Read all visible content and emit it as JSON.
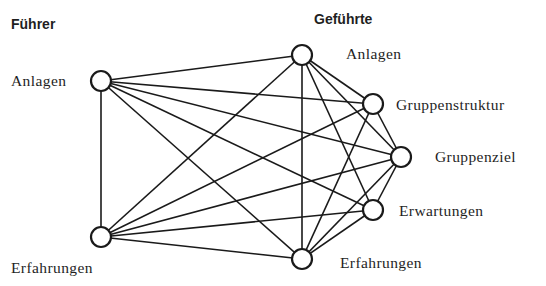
{
  "headings": {
    "leader": "Führer",
    "followers": "Geführte"
  },
  "nodes": [
    {
      "id": "fA",
      "group": "leader",
      "label": "Anlagen",
      "x": 101,
      "y": 81
    },
    {
      "id": "fE",
      "group": "leader",
      "label": "Erfahrungen",
      "x": 101,
      "y": 237
    },
    {
      "id": "gA",
      "group": "follower",
      "label": "Anlagen",
      "x": 302,
      "y": 55
    },
    {
      "id": "gS",
      "group": "follower",
      "label": "Gruppenstruktur",
      "x": 373,
      "y": 104
    },
    {
      "id": "gZ",
      "group": "follower",
      "label": "Gruppenziel",
      "x": 401,
      "y": 157
    },
    {
      "id": "gW",
      "group": "follower",
      "label": "Erwartungen",
      "x": 373,
      "y": 210
    },
    {
      "id": "gE",
      "group": "follower",
      "label": "Erfahrungen",
      "x": 302,
      "y": 259
    }
  ],
  "edges": [
    [
      "fA",
      "fE"
    ],
    [
      "fA",
      "gA"
    ],
    [
      "fA",
      "gS"
    ],
    [
      "fA",
      "gZ"
    ],
    [
      "fA",
      "gW"
    ],
    [
      "fA",
      "gE"
    ],
    [
      "fE",
      "gA"
    ],
    [
      "fE",
      "gS"
    ],
    [
      "fE",
      "gZ"
    ],
    [
      "fE",
      "gW"
    ],
    [
      "fE",
      "gE"
    ],
    [
      "gA",
      "gS"
    ],
    [
      "gA",
      "gZ"
    ],
    [
      "gA",
      "gW"
    ],
    [
      "gA",
      "gE"
    ],
    [
      "gS",
      "gZ"
    ],
    [
      "gS",
      "gE"
    ],
    [
      "gZ",
      "gW"
    ],
    [
      "gZ",
      "gE"
    ],
    [
      "gW",
      "gE"
    ]
  ],
  "labels": {
    "leader_anlagen": "Anlagen",
    "leader_erfahrungen": "Erfahrungen",
    "follower_anlagen": "Anlagen",
    "follower_gruppenstruktur": "Gruppenstruktur",
    "follower_gruppenziel": "Gruppenziel",
    "follower_erwartungen": "Erwartungen",
    "follower_erfahrungen": "Erfahrungen"
  }
}
